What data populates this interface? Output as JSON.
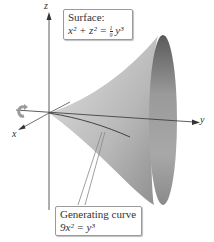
{
  "figure": {
    "type": "surface of revolution diagram",
    "axes": {
      "x": "x",
      "y": "y",
      "z": "z"
    },
    "surface_callout": {
      "title": "Surface:",
      "lhs": "x² + z² = ",
      "frac_num": "1",
      "frac_den": "9",
      "rhs": "y³"
    },
    "curve_callout": {
      "title": "Generating curve",
      "equation_lhs": "9x² = y³"
    },
    "colors": {
      "surface_light": "#d6d6d6",
      "surface_dark": "#6e6e6e",
      "axis": "#333333",
      "box_border": "#9a9a9a"
    }
  }
}
